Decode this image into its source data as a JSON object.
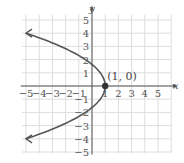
{
  "chart_data": {
    "type": "line",
    "title": "",
    "xlabel": "x",
    "ylabel": "y",
    "xlim": [
      -5,
      5
    ],
    "ylim": [
      -5,
      5
    ],
    "grid": true,
    "x_ticks": [
      -5,
      -4,
      -3,
      -2,
      -1,
      1,
      2,
      3,
      4,
      5
    ],
    "y_ticks": [
      5,
      4,
      3,
      2,
      1,
      -1,
      -2,
      -3,
      -4,
      -5
    ],
    "x_tick_labels": [
      "−5",
      "−4",
      "−3",
      "−2",
      "−1",
      "1",
      "2",
      "3",
      "4",
      "5"
    ],
    "y_tick_labels": [
      "5",
      "4",
      "3",
      "2",
      "1",
      "−1",
      "−2",
      "−3",
      "−4",
      "−5"
    ],
    "series": [
      {
        "name": "x = 1 - 0.375 y^2 (parabola opening left)",
        "x": [
          -5,
          -3,
          -1,
          0,
          0.625,
          1,
          0.625,
          0,
          -1,
          -3,
          -5
        ],
        "y": [
          4,
          3.27,
          2.31,
          1.63,
          1,
          0,
          -1,
          -1.63,
          -2.31,
          -3.27,
          -4
        ],
        "arrows_at_ends": true,
        "color": "#555555"
      }
    ],
    "annotations": [
      {
        "text": "(1, 0)",
        "x": 1,
        "y": 0,
        "marker": "filled-dot"
      }
    ]
  },
  "labels": {
    "x_axis": "x",
    "y_axis": "y",
    "vertex": "(1, 0)"
  },
  "colors": {
    "grid": "#dddddd",
    "axis": "#555555",
    "curve": "#555555",
    "point": "#333333"
  }
}
